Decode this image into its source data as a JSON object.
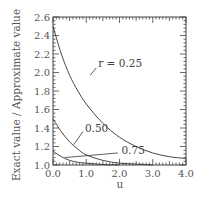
{
  "chart_data": {
    "type": "line",
    "title": "",
    "xlabel": "u",
    "ylabel": "Exact value / Approximate value",
    "xlim": [
      0.0,
      4.0
    ],
    "ylim": [
      1.0,
      2.6
    ],
    "xticks": [
      "0.0",
      "1.0",
      "2.0",
      "3.0",
      "4.0"
    ],
    "yticks": [
      "1.0",
      "1.2",
      "1.4",
      "1.6",
      "1.8",
      "2.0",
      "2.2",
      "2.4",
      "2.6"
    ],
    "grid": false,
    "legend": "none (inline annotations)",
    "series": [
      {
        "name": "r = 0.25",
        "label": "r = 0.25",
        "x": [
          0.0,
          0.25,
          0.5,
          0.75,
          1.0,
          1.5,
          2.0,
          2.5,
          3.0,
          3.5,
          4.0
        ],
        "y": [
          2.5,
          2.2,
          1.97,
          1.8,
          1.66,
          1.45,
          1.3,
          1.2,
          1.13,
          1.09,
          1.07
        ]
      },
      {
        "name": "r = 0.50",
        "label": "0.50",
        "x": [
          0.0,
          0.25,
          0.5,
          0.75,
          1.0,
          1.5,
          2.0,
          2.5,
          3.0
        ],
        "y": [
          1.5,
          1.36,
          1.25,
          1.17,
          1.11,
          1.05,
          1.02,
          1.01,
          1.0
        ]
      },
      {
        "name": "r = 0.75",
        "label": "0.75",
        "x": [
          0.0,
          0.25,
          0.5,
          0.75,
          1.0,
          1.5,
          2.0
        ],
        "y": [
          1.15,
          1.09,
          1.05,
          1.03,
          1.02,
          1.005,
          1.0
        ]
      }
    ],
    "annotations": [
      {
        "text": "r = 0.25",
        "x": 1.3,
        "y": 2.1
      },
      {
        "text": "0.50",
        "x": 0.9,
        "y": 1.4
      },
      {
        "text": "0.75",
        "x": 2.0,
        "y": 1.16
      }
    ]
  }
}
